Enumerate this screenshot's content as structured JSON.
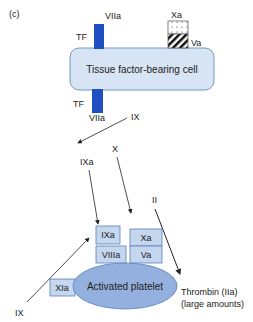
{
  "panel_label": "(c)",
  "colors": {
    "cell_fill": "#d7e4f4",
    "cell_stroke": "#5a7fb8",
    "receptor": "#1f4fc0",
    "platelet_fill": "#93b0df",
    "box_fill": "#c5d6ef",
    "box_stroke": "#5a7fb8"
  },
  "tissue_cell": {
    "label": "Tissue factor-bearing cell",
    "top_receptor": {
      "tf": "TF",
      "factor": "VIIa"
    },
    "bottom_receptor": {
      "tf": "TF",
      "factor": "VIIa"
    },
    "complex": {
      "top": "Xa",
      "bottom": "Va"
    }
  },
  "flow": {
    "ix_top": "IX",
    "ixa": "IXa",
    "x": "X",
    "ii": "II"
  },
  "platelet": {
    "label": "Activated platelet",
    "boxes": {
      "ixa": "IXa",
      "viiia": "VIIIa",
      "xa": "Xa",
      "va": "Va",
      "xia": "XIa"
    },
    "ix_bottom": "IX"
  },
  "thrombin": {
    "line1": "Thrombin (IIa)",
    "line2": "(large amounts)"
  }
}
